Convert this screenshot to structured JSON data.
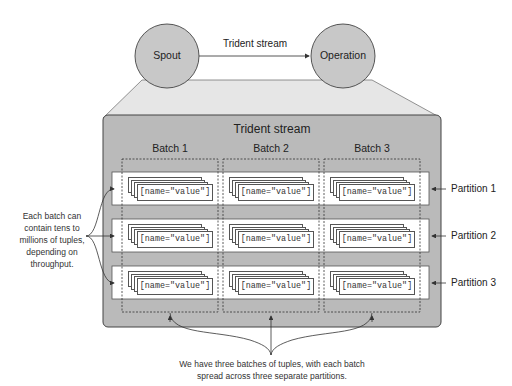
{
  "nodes": {
    "spout": "Spout",
    "operation": "Operation",
    "edge_label": "Trident stream"
  },
  "stream_box": {
    "title": "Trident stream",
    "batches": [
      "Batch 1",
      "Batch 2",
      "Batch 3"
    ],
    "partitions": [
      "Partition 1",
      "Partition 2",
      "Partition 3"
    ],
    "tuple_text": "[name=\"value\"]"
  },
  "annotations": {
    "left_note": "Each batch can contain tens to millions of tuples, depending on throughput.",
    "bottom_note_line1": "We have three batches of tuples, with each batch",
    "bottom_note_line2": "spread across three separate partitions."
  },
  "colors": {
    "circle_fill": "#c8c8c8",
    "box_fill": "#b9b9b9",
    "trapezoid_fill": "#e6e6e6",
    "partition_fill": "#ffffff",
    "line": "#444444"
  }
}
